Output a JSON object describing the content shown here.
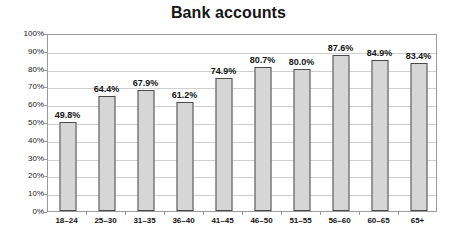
{
  "chart_data": {
    "type": "bar",
    "title": "Bank accounts",
    "xlabel": "",
    "ylabel": "",
    "ylim": [
      0,
      100
    ],
    "ytick_labels": [
      "0%",
      "10%",
      "20%",
      "30%",
      "40%",
      "50%",
      "60%",
      "70%",
      "80%",
      "90%",
      "100%"
    ],
    "ytick_values": [
      0,
      10,
      20,
      30,
      40,
      50,
      60,
      70,
      80,
      90,
      100
    ],
    "grid": "horizontal",
    "legend": "none",
    "categories": [
      "18–24",
      "25–30",
      "31–35",
      "36–40",
      "41–45",
      "46–50",
      "51–55",
      "56–60",
      "60–65",
      "65+"
    ],
    "values": [
      49.8,
      64.4,
      67.9,
      61.2,
      74.9,
      80.7,
      80.0,
      87.6,
      84.9,
      83.4
    ],
    "value_labels": [
      "49.8%",
      "64.4%",
      "67.9%",
      "61.2%",
      "74.9%",
      "80.7%",
      "80.0%",
      "87.6%",
      "84.9%",
      "83.4%"
    ],
    "bar_fill_color": "#d6d6d6",
    "bar_border_color": "#4a4a4a",
    "gridline_color": "#cfcfcf",
    "plot_border_color": "#9a9a9a",
    "background_color": "#ffffff",
    "text_color": "#141414"
  }
}
